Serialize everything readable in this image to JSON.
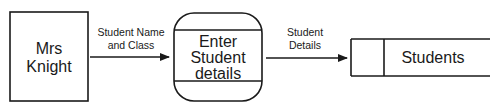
{
  "diagram": {
    "type": "data-flow-diagram",
    "external_entity": {
      "lines": [
        "Mrs",
        "Knight"
      ]
    },
    "flow_1": {
      "lines": [
        "Student Name",
        "and Class"
      ]
    },
    "process": {
      "lines": [
        "Enter",
        "Student",
        "details"
      ]
    },
    "flow_2": {
      "lines": [
        "Student",
        "Details"
      ]
    },
    "data_store": {
      "label": "Students"
    }
  }
}
